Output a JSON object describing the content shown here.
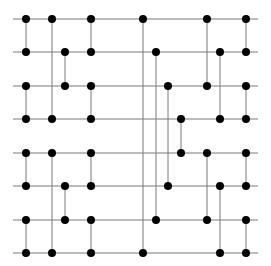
{
  "diagram": {
    "type": "sorting-network",
    "wire_count": 8,
    "wire_x_start": 13,
    "wire_x_end": 258,
    "wire_y": [
      19,
      52,
      86,
      119,
      153,
      186,
      220,
      253
    ],
    "line_color": "#7a7a7a",
    "node_color": "#000000",
    "node_radius": 4,
    "comparators": [
      {
        "x": 26,
        "from": 0,
        "to": 1
      },
      {
        "x": 26,
        "from": 2,
        "to": 3
      },
      {
        "x": 26,
        "from": 4,
        "to": 5
      },
      {
        "x": 26,
        "from": 6,
        "to": 7
      },
      {
        "x": 52,
        "from": 0,
        "to": 3
      },
      {
        "x": 52,
        "from": 4,
        "to": 7
      },
      {
        "x": 65,
        "from": 1,
        "to": 2
      },
      {
        "x": 65,
        "from": 5,
        "to": 6
      },
      {
        "x": 91,
        "from": 0,
        "to": 1
      },
      {
        "x": 91,
        "from": 2,
        "to": 3
      },
      {
        "x": 91,
        "from": 4,
        "to": 5
      },
      {
        "x": 91,
        "from": 6,
        "to": 7
      },
      {
        "x": 143,
        "from": 0,
        "to": 7
      },
      {
        "x": 156,
        "from": 1,
        "to": 6
      },
      {
        "x": 168,
        "from": 2,
        "to": 5
      },
      {
        "x": 181,
        "from": 3,
        "to": 4
      },
      {
        "x": 207,
        "from": 0,
        "to": 2
      },
      {
        "x": 207,
        "from": 4,
        "to": 6
      },
      {
        "x": 220,
        "from": 1,
        "to": 3
      },
      {
        "x": 220,
        "from": 5,
        "to": 7
      },
      {
        "x": 246,
        "from": 0,
        "to": 1
      },
      {
        "x": 246,
        "from": 2,
        "to": 3
      },
      {
        "x": 246,
        "from": 4,
        "to": 5
      },
      {
        "x": 246,
        "from": 6,
        "to": 7
      }
    ]
  }
}
